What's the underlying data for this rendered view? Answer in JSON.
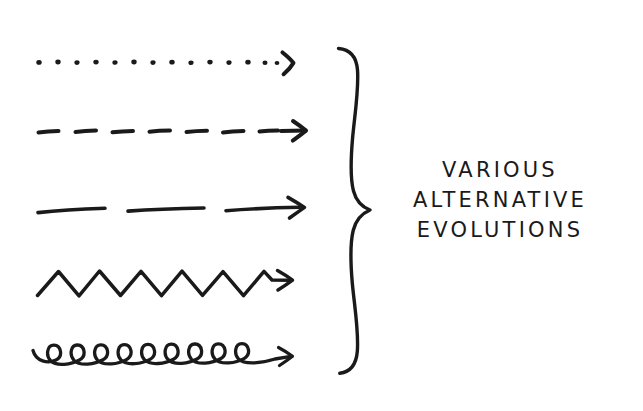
{
  "canvas": {
    "width": 643,
    "height": 411,
    "background_color": "#ffffff",
    "ink_color": "#1a1a1a"
  },
  "caption": {
    "lines": [
      "VARIOUS",
      "ALTERNATIVE",
      "EVOLUTIONS"
    ],
    "full_text": "VARIOUS ALTERNATIVE EVOLUTIONS",
    "align": "center",
    "case": "uppercase"
  },
  "brace": {
    "name": "curly-brace",
    "orientation": "right-pointing",
    "top_y": 48,
    "bottom_y": 373,
    "apex_x": 370,
    "apex_y": 210,
    "spine_x": 352
  },
  "arrows": [
    {
      "id": "dotted-arrow",
      "style": "dotted",
      "label": "dotted line with chevron arrowhead",
      "y": 62,
      "x_start": 38,
      "x_end": 292,
      "dot_count": 14,
      "arrowhead": "chevron"
    },
    {
      "id": "dashed-arrow",
      "style": "dashed",
      "label": "short dashed line with arrowhead",
      "y": 131,
      "x_start": 38,
      "x_end": 305,
      "dash_count": 7,
      "arrowhead": "open-v"
    },
    {
      "id": "long-dash-arrow",
      "style": "long-dash",
      "label": "long dashed line with arrowhead",
      "y": 209,
      "x_start": 38,
      "x_end": 305,
      "dash_count": 3,
      "arrowhead": "open-v"
    },
    {
      "id": "zigzag-arrow",
      "style": "zigzag",
      "label": "zigzag line with arrowhead",
      "y": 283,
      "x_start": 38,
      "x_end": 292,
      "peak_count": 6,
      "amplitude": 12,
      "arrowhead": "open-v"
    },
    {
      "id": "coil-arrow",
      "style": "coil",
      "label": "looping coil line with arrowhead",
      "y": 358,
      "x_start": 33,
      "x_end": 292,
      "loop_count": 8,
      "arrowhead": "open-v"
    }
  ]
}
